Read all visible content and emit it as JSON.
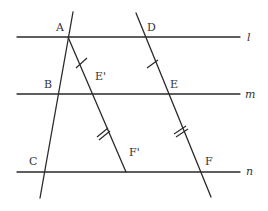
{
  "diagram": {
    "type": "geometry-parallel-lines",
    "colors": {
      "stroke": "#2a2a2a",
      "label": "#333333",
      "background": "#ffffff"
    },
    "parallel_lines": [
      {
        "name": "l",
        "label": "l",
        "y": 37
      },
      {
        "name": "m",
        "label": "m",
        "y": 94
      },
      {
        "name": "n",
        "label": "n",
        "y": 172
      }
    ],
    "points": {
      "A": {
        "label": "A",
        "x": 68,
        "y": 37
      },
      "B": {
        "label": "B",
        "x": 57,
        "y": 94
      },
      "C": {
        "label": "C",
        "x": 43,
        "y": 172
      },
      "D": {
        "label": "D",
        "x": 144,
        "y": 37
      },
      "E": {
        "label": "E",
        "x": 170,
        "y": 94
      },
      "F": {
        "label": "F",
        "x": 199,
        "y": 172
      },
      "E_prime": {
        "label": "E'",
        "x": 93,
        "y": 94
      },
      "F_prime": {
        "label": "F'",
        "x": 126,
        "y": 172
      }
    },
    "transversals": [
      {
        "name": "ABC",
        "through": [
          "A",
          "B",
          "C"
        ]
      },
      {
        "name": "AE'F'",
        "through": [
          "A",
          "E'",
          "F'"
        ]
      },
      {
        "name": "DEF",
        "through": [
          "D",
          "E",
          "F"
        ]
      }
    ],
    "tick_marks": [
      {
        "segment": "AE'",
        "count": 1
      },
      {
        "segment": "E'F'",
        "count": 2
      },
      {
        "segment": "DE",
        "count": 1
      },
      {
        "segment": "EF",
        "count": 2
      }
    ]
  }
}
